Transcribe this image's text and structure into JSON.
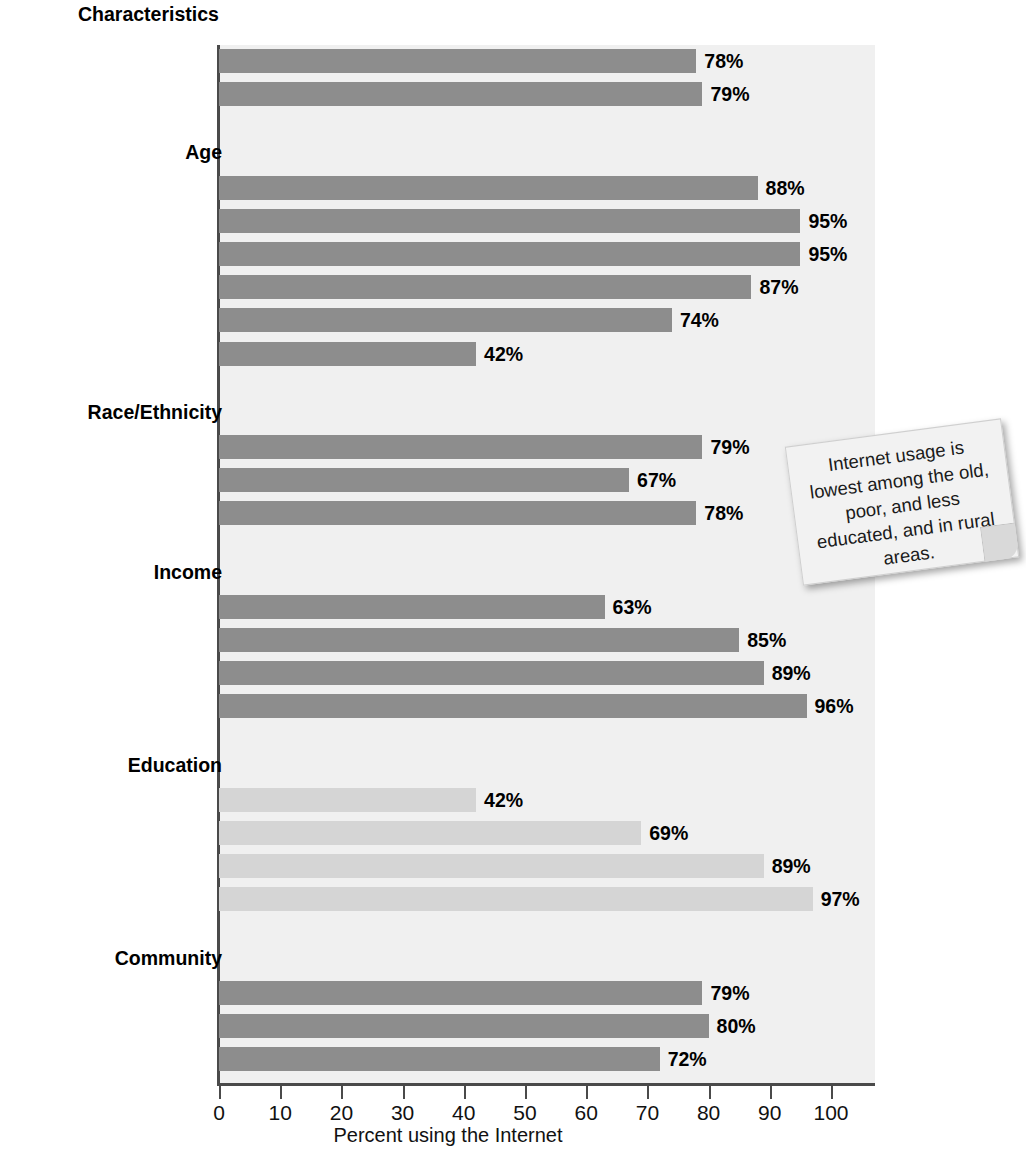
{
  "chart_data": {
    "type": "bar",
    "orientation": "horizontal",
    "title": "Characteristics",
    "xlabel": "Percent using the Internet",
    "ylabel": "",
    "xlim": [
      0,
      100
    ],
    "xticks": [
      0,
      10,
      20,
      30,
      40,
      50,
      60,
      70,
      80,
      90,
      100
    ],
    "xtick_labels": [
      "0",
      "10",
      "20",
      "30",
      "40",
      "50",
      "60",
      "70",
      "80",
      "90",
      "100"
    ],
    "grid": false,
    "legend": "none",
    "value_suffix": "%",
    "groups": [
      {
        "name": "",
        "heading": "",
        "shade": "dark",
        "rows": [
          {
            "label": "Men",
            "value": 78,
            "value_label": "78%"
          },
          {
            "label": "Women",
            "value": 79,
            "value_label": "79%"
          }
        ]
      },
      {
        "name": "Age",
        "heading": "Age",
        "shade": "dark",
        "rows": [
          {
            "label": "12–13",
            "value": 88,
            "value_label": "88%"
          },
          {
            "label": "14–17",
            "value": 95,
            "value_label": "95%"
          },
          {
            "label": "18–29",
            "value": 95,
            "value_label": "95%"
          },
          {
            "label": "30–49",
            "value": 87,
            "value_label": "87%"
          },
          {
            "label": "50–64",
            "value": 74,
            "value_label": "74%"
          },
          {
            "label": "65+",
            "value": 42,
            "value_label": "42%"
          }
        ]
      },
      {
        "name": "Race/Ethnicity",
        "heading": "Race/Ethnicity",
        "shade": "dark",
        "rows": [
          {
            "label": "White Non-Hispanic",
            "value": 79,
            "value_label": "79%"
          },
          {
            "label": "Black",
            "value": 67,
            "value_label": "67%"
          },
          {
            "label": "Hispanic",
            "value": 78,
            "value_label": "78%"
          }
        ]
      },
      {
        "name": "Income",
        "heading": "Income",
        "shade": "dark",
        "rows": [
          {
            "label": "Under $30,000",
            "value": 63,
            "value_label": "63%"
          },
          {
            "label": "$30–49,999",
            "value": 85,
            "value_label": "85%"
          },
          {
            "label": "$50–74,999",
            "value": 89,
            "value_label": "89%"
          },
          {
            "label": "$75,000+",
            "value": 96,
            "value_label": "96%"
          }
        ]
      },
      {
        "name": "Education",
        "heading": "Education",
        "shade": "light",
        "rows": [
          {
            "label": "Less than high school",
            "value": 42,
            "value_label": "42%"
          },
          {
            "label": "High school",
            "value": 69,
            "value_label": "69%"
          },
          {
            "label": "Some college",
            "value": 89,
            "value_label": "89%"
          },
          {
            "label": "College",
            "value": 97,
            "value_label": "97%"
          }
        ]
      },
      {
        "name": "Community",
        "heading": "Community",
        "shade": "dark",
        "rows": [
          {
            "label": "Urban",
            "value": 79,
            "value_label": "79%"
          },
          {
            "label": "Suburban",
            "value": 80,
            "value_label": "80%"
          },
          {
            "label": "Rural",
            "value": 72,
            "value_label": "72%"
          }
        ]
      }
    ],
    "colors": {
      "bar_dark": "#8d8d8d",
      "bar_light": "#d5d5d5",
      "plot_background": "#f0f0f0",
      "axis": "#4a4a4a",
      "text": "#111111"
    }
  },
  "callout": {
    "text": "Internet usage is lowest among the old, poor, and less educated, and in rural areas."
  }
}
